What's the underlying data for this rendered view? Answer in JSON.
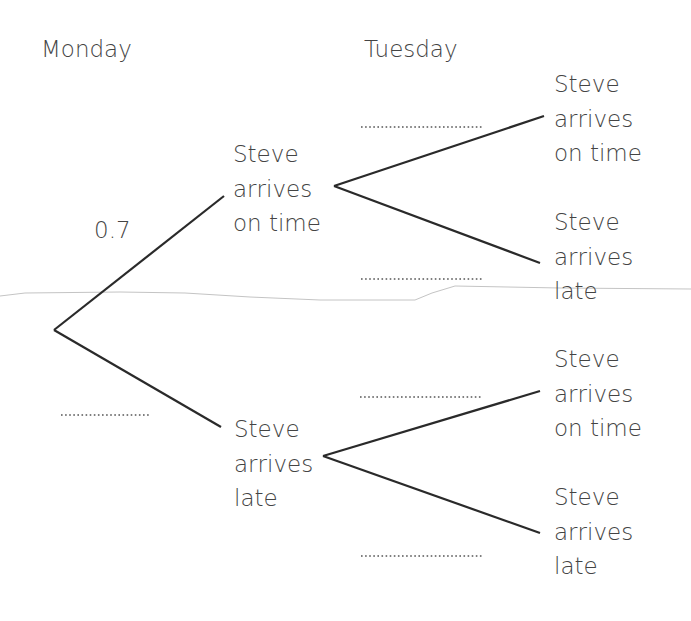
{
  "headers": {
    "day1": "Monday",
    "day2": "Tuesday"
  },
  "nodes": {
    "monday_on_time": [
      "Steve",
      "arrives",
      "on time"
    ],
    "monday_late": [
      "Steve",
      "arrives",
      "late"
    ],
    "tuesday_on_time_after_on_time": [
      "Steve",
      "arrives",
      "on time"
    ],
    "tuesday_late_after_on_time": [
      "Steve",
      "arrives",
      "late"
    ],
    "tuesday_on_time_after_late": [
      "Steve",
      "arrives",
      "on time"
    ],
    "tuesday_late_after_late": [
      "Steve",
      "arrives",
      "late"
    ]
  },
  "probabilities": {
    "monday_on_time": "0.7",
    "monday_late": "",
    "tuesday_on_time_after_on_time": "",
    "tuesday_late_after_on_time": "",
    "tuesday_on_time_after_late": "",
    "tuesday_late_after_late": ""
  },
  "colors": {
    "line": "#2a2a2a",
    "text": "#444444",
    "dots": "#555555",
    "stray_line": "#bbbbbb"
  }
}
